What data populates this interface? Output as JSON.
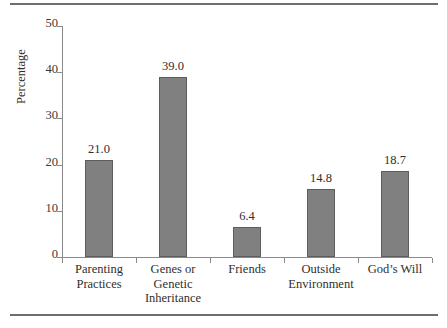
{
  "chart_data": {
    "type": "bar",
    "title": "",
    "subtitle": "",
    "xlabel": "",
    "ylabel": "Percentage",
    "ylim": [
      0,
      50
    ],
    "ytick_labels": [
      "0",
      "10",
      "20",
      "30",
      "40",
      "50"
    ],
    "ytick_values": [
      0,
      10,
      20,
      30,
      40,
      50
    ],
    "grid": false,
    "legend": null,
    "categories": [
      "Parenting Practices",
      "Genes or Genetic Inheritance",
      "Friends",
      "Outside Environment",
      "God’s Will"
    ],
    "category_lines": [
      [
        "Parenting",
        "Practices"
      ],
      [
        "Genes or",
        "Genetic",
        "Inheritance"
      ],
      [
        "Friends"
      ],
      [
        "Outside",
        "Environment"
      ],
      [
        "God’s Will"
      ]
    ],
    "values": [
      21.0,
      39.0,
      6.4,
      14.8,
      18.7
    ],
    "value_labels": [
      "21.0",
      "39.0",
      "6.4",
      "14.8",
      "18.7"
    ],
    "colors": {
      "bar_fill": "#808080",
      "bar_border": "#5d5d5d",
      "axis": "#8a8a8a",
      "text": "#2f2f2f",
      "rule": "#6e6e6e",
      "background": "#ffffff"
    }
  }
}
